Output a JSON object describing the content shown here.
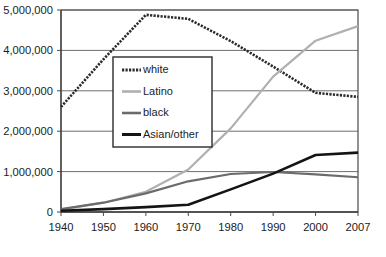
{
  "chart_data": {
    "type": "line",
    "title": "",
    "xlabel": "",
    "ylabel": "",
    "x": [
      1940,
      1950,
      1960,
      1970,
      1980,
      1990,
      2000,
      2007
    ],
    "xtick_labels": [
      "1940",
      "1950",
      "1960",
      "1970",
      "1980",
      "1990",
      "2000",
      "2007"
    ],
    "ytick_labels": [
      "0",
      "1,000,000",
      "2,000,000",
      "3,000,000",
      "4,000,000",
      "5,000,000"
    ],
    "yticks": [
      0,
      1000000,
      2000000,
      3000000,
      4000000,
      5000000
    ],
    "xlim": [
      1940,
      2007
    ],
    "ylim": [
      0,
      5000000
    ],
    "grid": "horizontal",
    "legend_position": "upper-center-left",
    "series": [
      {
        "name": "white",
        "color": "#2b2b2b",
        "style": "dotted-thick",
        "values": [
          2600000,
          3780000,
          4880000,
          4780000,
          4230000,
          3600000,
          2950000,
          2850000
        ]
      },
      {
        "name": "Latino",
        "color": "#b0b0b0",
        "style": "solid",
        "values": [
          60000,
          230000,
          500000,
          1050000,
          2070000,
          3350000,
          4240000,
          4600000
        ]
      },
      {
        "name": "black",
        "color": "#6b6b6b",
        "style": "solid",
        "values": [
          70000,
          230000,
          460000,
          760000,
          940000,
          990000,
          930000,
          860000
        ]
      },
      {
        "name": "Asian/other",
        "color": "#141414",
        "style": "solid",
        "values": [
          30000,
          70000,
          120000,
          180000,
          560000,
          950000,
          1410000,
          1470000
        ]
      }
    ]
  },
  "legend": {
    "items": [
      {
        "label": "white"
      },
      {
        "label": "Latino"
      },
      {
        "label": "black"
      },
      {
        "label": "Asian/other"
      }
    ]
  }
}
